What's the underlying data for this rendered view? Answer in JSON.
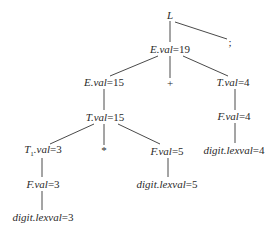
{
  "diagram": {
    "type": "annotated-parse-tree",
    "nodes": {
      "root": {
        "symbol": "L"
      },
      "semicolon": {
        "symbol": ";"
      },
      "e19": {
        "symbol": "E",
        "attr": ".val",
        "eq": "=19"
      },
      "e15": {
        "symbol": "E",
        "attr": ".val",
        "eq": "=15"
      },
      "plus": {
        "symbol": "+"
      },
      "t4": {
        "symbol": "T",
        "attr": ".val",
        "eq": "=4"
      },
      "t15": {
        "symbol": "T",
        "attr": ".val",
        "eq": "=15"
      },
      "f4": {
        "symbol": "F",
        "attr": ".val",
        "eq": "=4"
      },
      "t1_3": {
        "symbol": "T",
        "sub": "1",
        "attr": ".val",
        "eq": "=3"
      },
      "star": {
        "symbol": "*"
      },
      "f5": {
        "symbol": "F",
        "attr": ".val",
        "eq": "=5"
      },
      "digit4": {
        "symbol": "digit",
        "attr": ".lexval",
        "eq": "=4"
      },
      "f3": {
        "symbol": "F",
        "attr": ".val",
        "eq": "=3"
      },
      "digit5": {
        "symbol": "digit",
        "attr": ".lexval",
        "eq": "=5"
      },
      "digit3": {
        "symbol": "digit",
        "attr": ".lexval",
        "eq": "=3"
      }
    },
    "edges": [
      [
        "root",
        "e19"
      ],
      [
        "root",
        "semicolon"
      ],
      [
        "e19",
        "e15"
      ],
      [
        "e19",
        "plus"
      ],
      [
        "e19",
        "t4"
      ],
      [
        "e15",
        "t15"
      ],
      [
        "t4",
        "f4"
      ],
      [
        "t15",
        "t1_3"
      ],
      [
        "t15",
        "star"
      ],
      [
        "t15",
        "f5"
      ],
      [
        "f4",
        "digit4"
      ],
      [
        "t1_3",
        "f3"
      ],
      [
        "f5",
        "digit5"
      ],
      [
        "f3",
        "digit3"
      ]
    ]
  }
}
